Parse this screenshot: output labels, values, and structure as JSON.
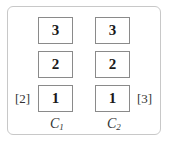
{
  "columns": [
    {
      "name_base": "C",
      "name_sub": "1",
      "side_label": "[2]",
      "boxes": [
        "3",
        "2",
        "1"
      ]
    },
    {
      "name_base": "C",
      "name_sub": "2",
      "side_label": "[3]",
      "boxes": [
        "3",
        "2",
        "1"
      ]
    }
  ],
  "colors": {
    "frame_border": "#c8c8c8",
    "box_border": "#8a8a8a",
    "text": "#1a1a1a"
  }
}
